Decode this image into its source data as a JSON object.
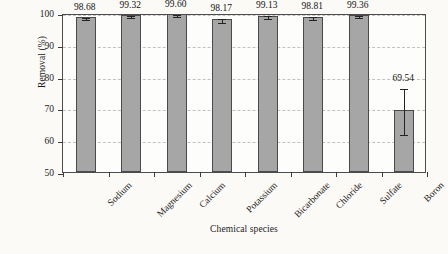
{
  "chart_data": {
    "type": "bar",
    "title": "",
    "subtitle": "",
    "xlabel": "Chemical species",
    "ylabel": "Removal (%)",
    "categories": [
      "Sodium",
      "Magnesium",
      "Calcium",
      "Potassium",
      "Bicarbonate",
      "Chloride",
      "Sulfate",
      "Boron"
    ],
    "values": [
      98.68,
      99.32,
      99.6,
      98.17,
      99.13,
      98.81,
      99.36,
      69.54
    ],
    "value_labels": [
      "98.68",
      "99.32",
      "99.60",
      "98.17",
      "99.13",
      "98.81",
      "99.36",
      "69.54"
    ],
    "errors": [
      0.35,
      0.3,
      0.25,
      0.55,
      0.4,
      0.45,
      0.2,
      7.2
    ],
    "ylim": [
      50,
      100
    ],
    "yticks": [
      50,
      60,
      70,
      80,
      90,
      100
    ],
    "ytick_labels": [
      "50",
      "60",
      "70",
      "80",
      "90",
      "100"
    ],
    "grid": true,
    "legend": "none",
    "bar_color": "#a6a6a6",
    "bar_edge_color": "#4a4a4a",
    "grid_color": "#c2c2c2",
    "axis_color": "#4c4c4c",
    "text_color": "#1b1b1b",
    "background_color": "#fbfaf7",
    "plot_background_color": "#fdfdfb",
    "error_bar_color": "#232323"
  }
}
